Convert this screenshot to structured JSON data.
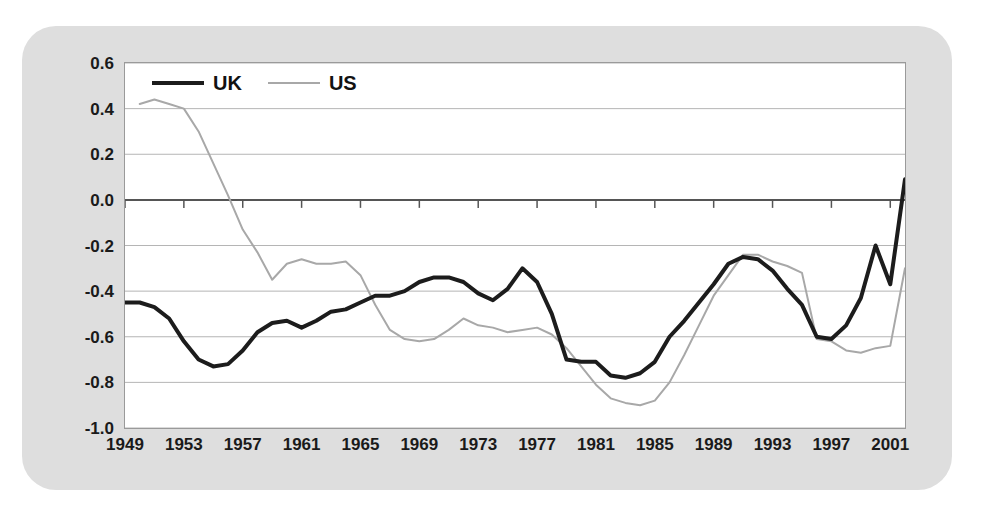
{
  "chart_data": {
    "type": "line",
    "title": "",
    "subtitle": "",
    "xlabel": "",
    "ylabel": "",
    "xlim": [
      1949,
      2002
    ],
    "ylim": [
      -1.0,
      0.6
    ],
    "grid": true,
    "grid_axis": "y",
    "legend_position": "top-left-inside",
    "y_ticks": [
      "0.6",
      "0.4",
      "0.2",
      "0.0",
      "-0.2",
      "-0.4",
      "-0.6",
      "-0.8",
      "-1.0"
    ],
    "y_tick_values": [
      0.6,
      0.4,
      0.2,
      0.0,
      -0.2,
      -0.4,
      -0.6,
      -0.8,
      -1.0
    ],
    "x_ticks": [
      "1949",
      "1953",
      "1957",
      "1961",
      "1965",
      "1969",
      "1973",
      "1977",
      "1981",
      "1985",
      "1989",
      "1993",
      "1997",
      "2001"
    ],
    "x_tick_values": [
      1949,
      1953,
      1957,
      1961,
      1965,
      1969,
      1973,
      1977,
      1981,
      1985,
      1989,
      1993,
      1997,
      2001
    ],
    "x": [
      1949,
      1950,
      1951,
      1952,
      1953,
      1954,
      1955,
      1956,
      1957,
      1958,
      1959,
      1960,
      1961,
      1962,
      1963,
      1964,
      1965,
      1966,
      1967,
      1968,
      1969,
      1970,
      1971,
      1972,
      1973,
      1974,
      1975,
      1976,
      1977,
      1978,
      1979,
      1980,
      1981,
      1982,
      1983,
      1984,
      1985,
      1986,
      1987,
      1988,
      1989,
      1990,
      1991,
      1992,
      1993,
      1994,
      1995,
      1996,
      1997,
      1998,
      1999,
      2000,
      2001,
      2002
    ],
    "series": [
      {
        "name": "UK",
        "color": "#1c1c1c",
        "linewidth": 4,
        "values": [
          -0.45,
          -0.45,
          -0.47,
          -0.52,
          -0.62,
          -0.7,
          -0.73,
          -0.72,
          -0.66,
          -0.58,
          -0.54,
          -0.53,
          -0.56,
          -0.53,
          -0.49,
          -0.48,
          -0.45,
          -0.42,
          -0.42,
          -0.4,
          -0.36,
          -0.34,
          -0.34,
          -0.36,
          -0.41,
          -0.44,
          -0.39,
          -0.3,
          -0.36,
          -0.5,
          -0.7,
          -0.71,
          -0.71,
          -0.77,
          -0.78,
          -0.76,
          -0.71,
          -0.6,
          -0.53,
          -0.45,
          -0.37,
          -0.28,
          -0.25,
          -0.26,
          -0.31,
          -0.39,
          -0.46,
          -0.5,
          -0.53,
          -0.53,
          -0.54,
          -0.53,
          -0.53,
          -0.54
        ]
      },
      {
        "name": "US",
        "color": "#a8a8a8",
        "linewidth": 2,
        "values": [
          null,
          0.42,
          0.44,
          0.42,
          0.4,
          0.3,
          0.16,
          0.02,
          -0.13,
          -0.23,
          -0.35,
          -0.28,
          -0.26,
          -0.28,
          -0.28,
          -0.27,
          -0.33,
          -0.46,
          -0.57,
          -0.61,
          -0.62,
          -0.61,
          -0.57,
          -0.52,
          -0.55,
          -0.56,
          -0.58,
          -0.57,
          -0.56,
          -0.59,
          -0.65,
          -0.73,
          -0.81,
          -0.87,
          -0.89,
          -0.9,
          -0.88,
          -0.8,
          -0.68,
          -0.55,
          -0.42,
          -0.33,
          -0.24,
          -0.24,
          -0.27,
          -0.29,
          -0.32,
          -0.34,
          -0.4,
          -0.46,
          -0.51,
          -0.58,
          -0.62,
          -0.61
        ]
      }
    ],
    "uk_tail": {
      "x": [
        1996,
        1997,
        1998,
        1999,
        2000,
        2001,
        2002
      ],
      "values": [
        -0.6,
        -0.61,
        -0.55,
        -0.43,
        -0.2,
        -0.37,
        0.09
      ]
    },
    "us_tail": {
      "x": [
        1996,
        1997,
        1998,
        1999,
        2000,
        2001,
        2002
      ],
      "values": [
        -0.61,
        -0.62,
        -0.66,
        -0.67,
        -0.65,
        -0.64,
        -0.3
      ]
    }
  },
  "legend": {
    "entries": [
      {
        "label": "UK",
        "style": "thick-solid-black"
      },
      {
        "label": "US",
        "style": "thin-solid-grey"
      }
    ]
  },
  "colors": {
    "page_background": "#ffffff",
    "panel_background": "#dedede",
    "plot_background": "#ffffff",
    "gridline": "#b5b5b5",
    "axis": "#555555",
    "uk_line": "#1c1c1c",
    "us_line": "#a8a8a8",
    "text": "#1a1a1a"
  }
}
